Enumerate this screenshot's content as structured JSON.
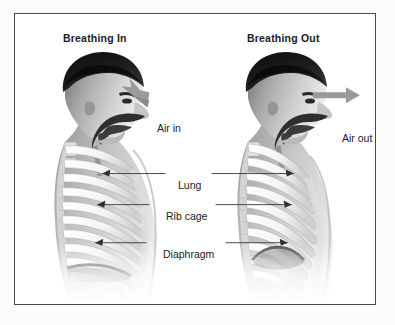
{
  "figure": {
    "panels": [
      {
        "id": "breathing-in",
        "title": "Breathing In",
        "air_label": "Air in",
        "air_direction": "in"
      },
      {
        "id": "breathing-out",
        "title": "Breathing Out",
        "air_label": "Air out",
        "air_direction": "out"
      }
    ],
    "anatomy_labels": [
      {
        "id": "lung",
        "text": "Lung"
      },
      {
        "id": "rib-cage",
        "text": "Rib cage"
      },
      {
        "id": "diaphragm",
        "text": "Diaphragm"
      }
    ],
    "colors": {
      "border": "#4a4a4a",
      "background": "#ffffff",
      "page": "#fbfbfa",
      "text": "#1b1b1b",
      "arrow": "#8d8d8d",
      "leader_line": "#3a3a3a",
      "hair_dark": "#171717",
      "skin_mid": "#9a9a9a",
      "bone_light": "#f2f2f2",
      "cavity_dark": "#2a2a2a"
    }
  }
}
